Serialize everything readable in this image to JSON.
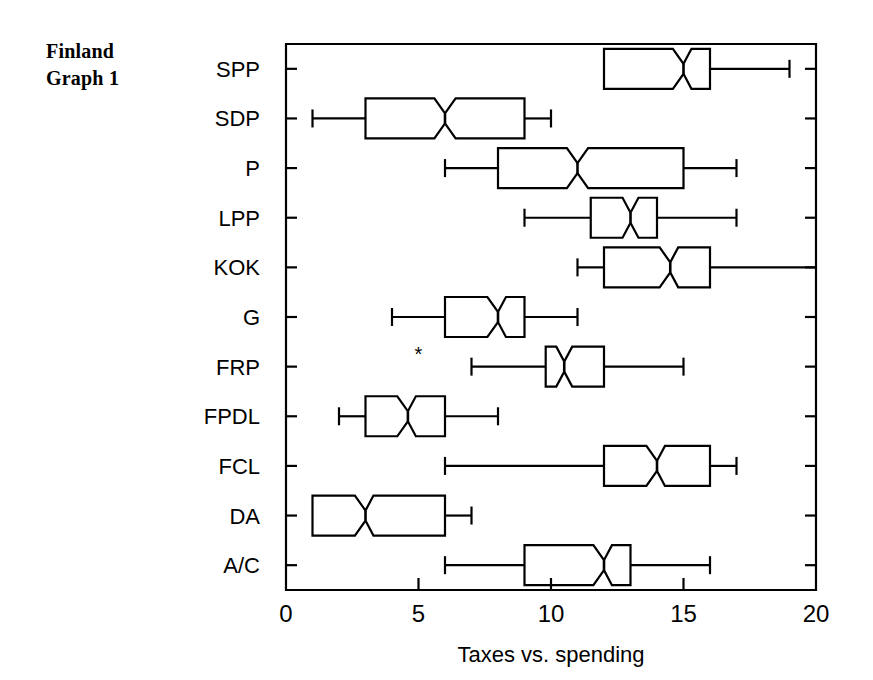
{
  "figure": {
    "corner_title": "Finland\nGraph 1",
    "background_color": "#ffffff",
    "line_color": "#000000"
  },
  "chart_data": {
    "type": "box",
    "title": "",
    "subtitle": "",
    "xlabel": "Taxes vs. spending",
    "ylabel": "",
    "xlim": [
      0,
      20
    ],
    "xticks": [
      0,
      5,
      10,
      15,
      20
    ],
    "xticklabels": [
      "0",
      "5",
      "10",
      "15",
      "20"
    ],
    "grid": false,
    "legend": false,
    "orientation": "horizontal",
    "notched": true,
    "categories": [
      "SPP",
      "SDP",
      "P",
      "LPP",
      "KOK",
      "G",
      "FRP",
      "FPDL",
      "FCL",
      "DA",
      "A/C"
    ],
    "boxes": [
      {
        "category": "SPP",
        "whisker_low": 12.0,
        "q1": 12.0,
        "median": 15.0,
        "q3": 16.0,
        "whisker_high": 19.0,
        "notch_low": 14.6,
        "notch_high": 15.3,
        "outliers": []
      },
      {
        "category": "SDP",
        "whisker_low": 1.0,
        "q1": 3.0,
        "median": 6.0,
        "q3": 9.0,
        "whisker_high": 10.0,
        "notch_low": 5.6,
        "notch_high": 6.4,
        "outliers": []
      },
      {
        "category": "P",
        "whisker_low": 6.0,
        "q1": 8.0,
        "median": 11.0,
        "q3": 15.0,
        "whisker_high": 17.0,
        "notch_low": 10.6,
        "notch_high": 11.4,
        "outliers": []
      },
      {
        "category": "LPP",
        "whisker_low": 9.0,
        "q1": 11.5,
        "median": 13.0,
        "q3": 14.0,
        "whisker_high": 17.0,
        "notch_low": 12.7,
        "notch_high": 13.3,
        "outliers": []
      },
      {
        "category": "KOK",
        "whisker_low": 11.0,
        "q1": 12.0,
        "median": 14.5,
        "q3": 16.0,
        "whisker_high": 20.0,
        "notch_low": 14.1,
        "notch_high": 14.8,
        "outliers": []
      },
      {
        "category": "G",
        "whisker_low": 4.0,
        "q1": 6.0,
        "median": 8.0,
        "q3": 9.0,
        "whisker_high": 11.0,
        "notch_low": 7.6,
        "notch_high": 8.3,
        "outliers": []
      },
      {
        "category": "FRP",
        "whisker_low": 7.0,
        "q1": 9.8,
        "median": 10.5,
        "q3": 12.0,
        "whisker_high": 15.0,
        "notch_low": 10.2,
        "notch_high": 10.8,
        "outliers": [
          5.0
        ]
      },
      {
        "category": "FPDL",
        "whisker_low": 2.0,
        "q1": 3.0,
        "median": 4.6,
        "q3": 6.0,
        "whisker_high": 8.0,
        "notch_low": 4.2,
        "notch_high": 4.9,
        "outliers": []
      },
      {
        "category": "FCL",
        "whisker_low": 6.0,
        "q1": 12.0,
        "median": 14.0,
        "q3": 16.0,
        "whisker_high": 17.0,
        "notch_low": 13.6,
        "notch_high": 14.3,
        "outliers": []
      },
      {
        "category": "DA",
        "whisker_low": 1.0,
        "q1": 1.0,
        "median": 3.0,
        "q3": 6.0,
        "whisker_high": 7.0,
        "notch_low": 2.6,
        "notch_high": 3.3,
        "outliers": []
      },
      {
        "category": "A/C",
        "whisker_low": 6.0,
        "q1": 9.0,
        "median": 12.0,
        "q3": 13.0,
        "whisker_high": 16.0,
        "notch_low": 11.6,
        "notch_high": 12.3,
        "outliers": []
      }
    ],
    "outlier_marker": "*"
  }
}
